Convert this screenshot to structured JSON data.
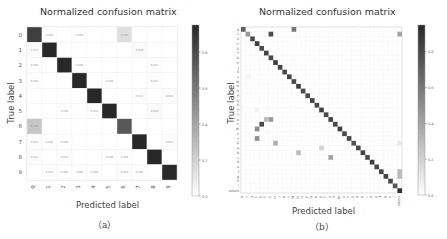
{
  "chart_data": [
    {
      "type": "heatmap",
      "title": "Normalized confusion matrix",
      "xlabel": "Predicted label",
      "ylabel": "True label",
      "caption": "（a）",
      "categories": [
        "0",
        "1",
        "2",
        "3",
        "4",
        "5",
        "6",
        "7",
        "8",
        "9"
      ],
      "colorbar": {
        "ticks": [
          0.0,
          0.2,
          0.4,
          0.6,
          0.8
        ],
        "range": [
          0,
          0.95
        ],
        "colormap": "Greys"
      },
      "matrix": [
        [
          0.85,
          0.006,
          0,
          0.006,
          0,
          0,
          0.14,
          0,
          0,
          0
        ],
        [
          0.013,
          0.96,
          0,
          0,
          0,
          0,
          0,
          0.02,
          0,
          0
        ],
        [
          0.006,
          0,
          0.97,
          0.006,
          0,
          0,
          0,
          0,
          0.013,
          0
        ],
        [
          0.006,
          0,
          0,
          0.97,
          0,
          0.006,
          0,
          0,
          0.013,
          0
        ],
        [
          0,
          0,
          0,
          0,
          0.97,
          0,
          0,
          0.013,
          0,
          0.013
        ],
        [
          0,
          0,
          0.006,
          0,
          0.013,
          0.95,
          0,
          0,
          0.02,
          0
        ],
        [
          0.25,
          0,
          0,
          0,
          0,
          0,
          0.74,
          0,
          0,
          0
        ],
        [
          0.013,
          0.006,
          0.006,
          0,
          0,
          0,
          0,
          0.96,
          0,
          0.013
        ],
        [
          0.013,
          0,
          0.013,
          0,
          0,
          0.006,
          0.006,
          0,
          0.96,
          0
        ],
        [
          0,
          0.013,
          0.006,
          0.006,
          0.006,
          0,
          0.013,
          0.006,
          0,
          0.94
        ]
      ]
    },
    {
      "type": "heatmap",
      "title": "Normalized confusion matrix",
      "xlabel": "Predicted label",
      "ylabel": "True label",
      "caption": "（b）",
      "categories": [
        "0",
        "1",
        "2",
        "C",
        "E",
        "F",
        "G",
        "H",
        "J",
        "K",
        "L",
        "M",
        "N",
        "O",
        "P",
        "Q",
        "R",
        "S",
        "T",
        "U",
        "V",
        "W",
        "X",
        "Y",
        "Z",
        "a",
        "b",
        "c",
        "d",
        "e",
        "f",
        "g",
        "h",
        "i",
        "others"
      ],
      "colorbar": {
        "ticks": [
          0.0,
          0.2,
          0.4,
          0.6,
          0.8
        ],
        "range": [
          0,
          0.95
        ],
        "colormap": "Greys"
      },
      "diagonal": [
        0.7,
        0.45,
        0.8,
        0.85,
        0.8,
        0.82,
        0.8,
        0.85,
        0.82,
        0.8,
        0.82,
        0.8,
        0.85,
        0.8,
        0.8,
        0.82,
        0.8,
        0.85,
        0.8,
        0.82,
        0.8,
        0.85,
        0.8,
        0.8,
        0.75,
        0.8,
        0.82,
        0.8,
        0.85,
        0.8,
        0.8,
        0.82,
        0.8,
        0.75,
        0.9
      ],
      "offdiag": [
        [
          0,
          11,
          0.6
        ],
        [
          1,
          6,
          0.8
        ],
        [
          2,
          2,
          0
        ],
        [
          0,
          25,
          0.02
        ],
        [
          1,
          34,
          0.4
        ],
        [
          19,
          6,
          0.45
        ],
        [
          19,
          5,
          0.3
        ],
        [
          20,
          4,
          0.8
        ],
        [
          21,
          3,
          0.5
        ],
        [
          24,
          7,
          0.35
        ],
        [
          23,
          3,
          0.5
        ],
        [
          26,
          12,
          0.3
        ],
        [
          27,
          19,
          0.4
        ],
        [
          25,
          17,
          0.2
        ],
        [
          24,
          34,
          0.1
        ],
        [
          30,
          34,
          0.3
        ],
        [
          31,
          34,
          0.3
        ],
        [
          10,
          1,
          0.05
        ],
        [
          17,
          3,
          0.05
        ]
      ]
    }
  ],
  "figure": {
    "left": {
      "title": "Normalized confusion matrix",
      "xlabel": "Predicted label",
      "ylabel": "True label",
      "caption": "（a）"
    },
    "right": {
      "title": "Normalized confusion matrix",
      "xlabel": "Predicted label",
      "ylabel": "True label",
      "caption": "（b）"
    }
  }
}
